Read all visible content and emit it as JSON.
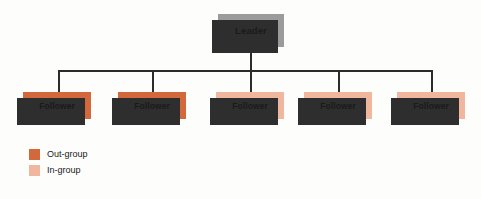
{
  "diagram": {
    "type": "organizational-hierarchy",
    "background_color": "#fdfdfc",
    "connector_color": "#2b2b2b",
    "shadow_color": "#2e2e2e"
  },
  "leader": {
    "label": "Leader",
    "color": "#9b9b9b"
  },
  "followers": [
    {
      "label": "Follower",
      "group": "out-group",
      "color": "#d2683c"
    },
    {
      "label": "Follower",
      "group": "out-group",
      "color": "#d2683c"
    },
    {
      "label": "Follower",
      "group": "in-group",
      "color": "#f0b79e"
    },
    {
      "label": "Follower",
      "group": "in-group",
      "color": "#f0b79e"
    },
    {
      "label": "Follower",
      "group": "in-group",
      "color": "#f0b79e"
    }
  ],
  "legend": {
    "items": [
      {
        "label": "Out-group",
        "color": "#d2683c"
      },
      {
        "label": "In-group",
        "color": "#f0b79e"
      }
    ]
  }
}
